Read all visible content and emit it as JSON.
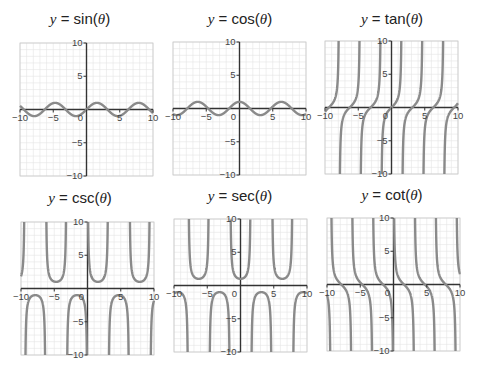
{
  "chart_data": [
    {
      "type": "line",
      "func": "sin",
      "title_prefix": "y = ",
      "title_fn": "sin",
      "title_arg": "θ",
      "xlim": [
        -10,
        10
      ],
      "ylim": [
        -10,
        10
      ],
      "xticks": [
        -10,
        -5,
        0,
        5,
        10
      ],
      "yticks": [
        -10,
        -5,
        5,
        10
      ],
      "grid": true,
      "box": {
        "left": 20,
        "top": 43,
        "size": 133
      },
      "title_pos": {
        "x": 0,
        "y": 10
      }
    },
    {
      "type": "line",
      "func": "cos",
      "title_prefix": "y = ",
      "title_fn": "cos",
      "title_arg": "θ",
      "xlim": [
        -10,
        10
      ],
      "ylim": [
        -10,
        10
      ],
      "xticks": [
        -10,
        -5,
        0,
        5,
        10
      ],
      "yticks": [
        -10,
        -5,
        5,
        10
      ],
      "grid": true,
      "box": {
        "left": 173,
        "top": 42,
        "size": 133
      },
      "title_pos": {
        "x": 160,
        "y": 10
      }
    },
    {
      "type": "line",
      "func": "tan",
      "title_prefix": "y = ",
      "title_fn": "tan",
      "title_arg": "θ",
      "xlim": [
        -10,
        10
      ],
      "ylim": [
        -10,
        10
      ],
      "xticks": [
        -10,
        -5,
        0,
        5,
        10
      ],
      "yticks": [
        -10,
        -5,
        5,
        10
      ],
      "grid": true,
      "box": {
        "left": 325,
        "top": 41,
        "size": 133
      },
      "title_pos": {
        "x": 312,
        "y": 10
      }
    },
    {
      "type": "line",
      "func": "csc",
      "title_prefix": "y = ",
      "title_fn": "csc",
      "title_arg": "θ",
      "xlim": [
        -10,
        10
      ],
      "ylim": [
        -10,
        10
      ],
      "xticks": [
        -10,
        -5,
        0,
        5,
        10
      ],
      "yticks": [
        -10,
        -5,
        5,
        10
      ],
      "grid": true,
      "box": {
        "left": 21,
        "top": 222,
        "size": 133
      },
      "title_pos": {
        "x": 0,
        "y": 189
      }
    },
    {
      "type": "line",
      "func": "sec",
      "title_prefix": "y = ",
      "title_fn": "sec",
      "title_arg": "θ",
      "xlim": [
        -10,
        10
      ],
      "ylim": [
        -10,
        10
      ],
      "xticks": [
        -10,
        -5,
        0,
        5,
        10
      ],
      "yticks": [
        -10,
        -5,
        5,
        10
      ],
      "grid": true,
      "box": {
        "left": 174,
        "top": 219,
        "size": 133
      },
      "title_pos": {
        "x": 160,
        "y": 187
      }
    },
    {
      "type": "line",
      "func": "cot",
      "title_prefix": "y = ",
      "title_fn": "cot",
      "title_arg": "θ",
      "xlim": [
        -10,
        10
      ],
      "ylim": [
        -10,
        10
      ],
      "xticks": [
        -10,
        -5,
        0,
        5,
        10
      ],
      "yticks": [
        -10,
        -5,
        5,
        10
      ],
      "grid": true,
      "box": {
        "left": 327,
        "top": 218,
        "size": 133
      },
      "title_pos": {
        "x": 312,
        "y": 186
      }
    }
  ],
  "colors": {
    "curve": "#8a8a8a",
    "axis": "#333333",
    "grid": "#e4e4e4",
    "border": "#c8c8c8"
  }
}
